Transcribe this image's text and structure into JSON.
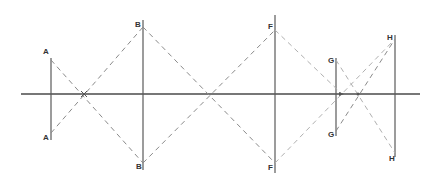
{
  "diagram": {
    "type": "optical-ray-diagram",
    "axis": {
      "x1": 21,
      "x2": 420,
      "y": 94
    },
    "objects": [
      {
        "id": "A",
        "x": 51,
        "top": 58,
        "bottom": 137,
        "label_top": "A",
        "label_bottom": "A"
      },
      {
        "id": "B",
        "x": 143,
        "top": 25,
        "bottom": 165,
        "label_top": "B",
        "label_bottom": "B"
      },
      {
        "id": "F",
        "x": 275,
        "top": 28,
        "bottom": 165,
        "label_top": "F",
        "label_bottom": "F"
      },
      {
        "id": "G",
        "x": 336,
        "top": 58,
        "bottom": 133,
        "label_top": "G",
        "label_bottom": "G"
      },
      {
        "id": "H",
        "x": 395,
        "top": 37,
        "bottom": 155,
        "label_top": "H",
        "label_bottom": "H"
      }
    ],
    "crossings": [
      {
        "x": 84,
        "y": 94
      },
      {
        "x": 211,
        "y": 94
      },
      {
        "x": 342,
        "y": 94
      },
      {
        "x": 358,
        "y": 94
      }
    ]
  }
}
